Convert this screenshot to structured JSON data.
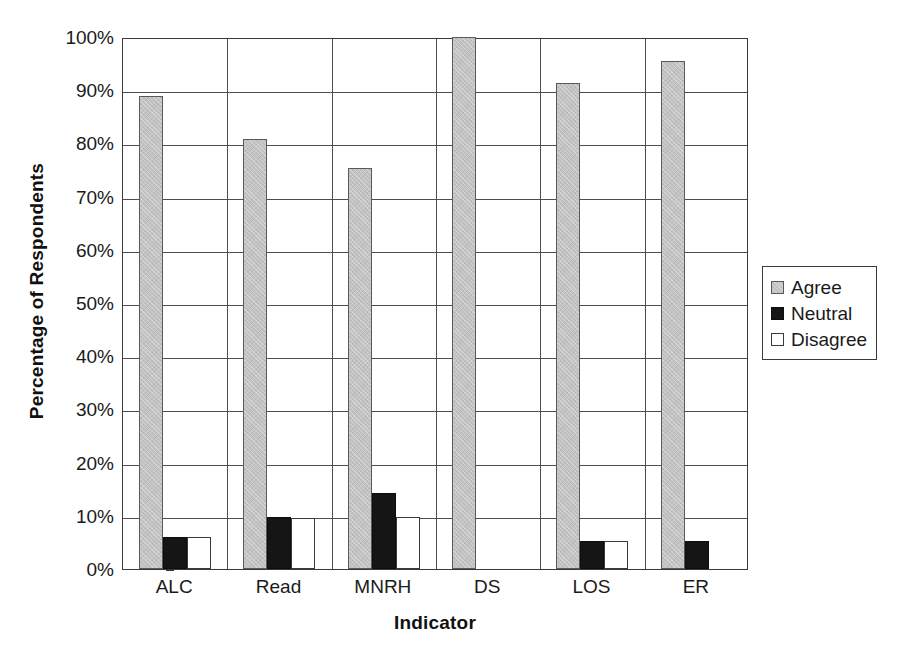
{
  "chart_data": {
    "type": "bar",
    "title": "",
    "xlabel": "Indicator",
    "ylabel": "Percentage of Respondents",
    "categories": [
      "ALC",
      "Read",
      "MNRH",
      "DS",
      "LOS",
      "ER"
    ],
    "series": [
      {
        "name": "Agree",
        "color": "#c2c2c2",
        "values": [
          89.0,
          80.8,
          75.3,
          100.0,
          91.4,
          95.5
        ]
      },
      {
        "name": "Neutral",
        "color": "#151515",
        "values": [
          6.1,
          9.8,
          14.3,
          0.0,
          5.2,
          5.2
        ]
      },
      {
        "name": "Disagree",
        "color": "#ffffff",
        "values": [
          6.1,
          9.6,
          9.8,
          0.0,
          5.2,
          0.0
        ]
      }
    ],
    "ylim": [
      0,
      100
    ],
    "yticks": [
      0,
      10,
      20,
      30,
      40,
      50,
      60,
      70,
      80,
      90,
      100
    ],
    "ytick_labels": [
      "0%",
      "10%",
      "20%",
      "30%",
      "40%",
      "50%",
      "60%",
      "70%",
      "80%",
      "90%",
      "100%"
    ],
    "grid": {
      "horizontal": true,
      "vertical": true
    },
    "legend": {
      "position": "right",
      "entries": [
        "Agree",
        "Neutral",
        "Disagree"
      ]
    }
  }
}
